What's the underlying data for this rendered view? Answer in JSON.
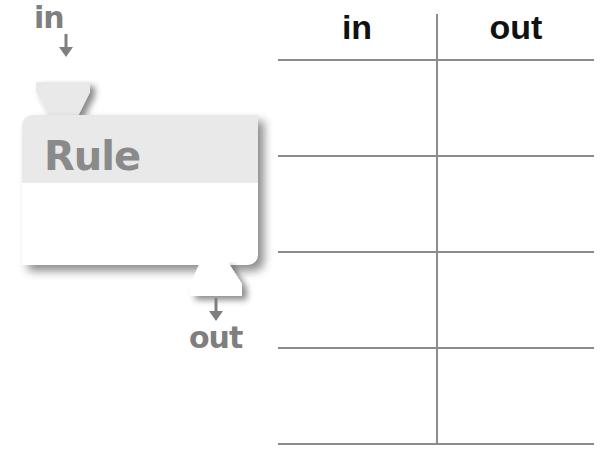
{
  "diagram": {
    "rule_box": {
      "title": "Rule",
      "input_label": "in",
      "output_label": "out"
    },
    "table": {
      "columns": [
        "in",
        "out"
      ],
      "rows": [
        {
          "in": "",
          "out": ""
        },
        {
          "in": "",
          "out": ""
        },
        {
          "in": "",
          "out": ""
        },
        {
          "in": "",
          "out": ""
        }
      ]
    },
    "colors": {
      "label_grey": "#7f7f7f",
      "header_band": "#e9e9e9",
      "table_lines": "#8c8c8c",
      "table_header_text": "#111111"
    }
  }
}
